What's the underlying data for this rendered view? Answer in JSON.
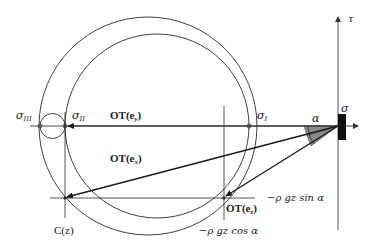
{
  "figure": {
    "type": "Mohr circle diagram",
    "axes": {
      "horizontal_label": "σ",
      "vertical_label": "τ"
    },
    "principal_stresses": {
      "sigma_I": {
        "symbol": "σ",
        "subscript": "I"
      },
      "sigma_II": {
        "symbol": "σ",
        "subscript": "II"
      },
      "sigma_III": {
        "symbol": "σ",
        "subscript": "III"
      }
    },
    "vectors": [
      {
        "id": "OT_ey",
        "label": "OT(e",
        "subscript": "y",
        "close": ")"
      },
      {
        "id": "OT_ex",
        "label": "OT(e",
        "subscript": "x",
        "close": ")"
      },
      {
        "id": "OT_ez",
        "label": "OT(e",
        "subscript": "z",
        "close": ")"
      }
    ],
    "point_label": "C(z)",
    "angle_label": "α",
    "component_labels": {
      "sin": "−ρ gz sin α",
      "cos": "−ρ gz cos α"
    },
    "colors": {
      "line": "#2a2a2a",
      "axis": "#555555",
      "wedge": "#8c8c8c",
      "block": "#111111"
    }
  }
}
